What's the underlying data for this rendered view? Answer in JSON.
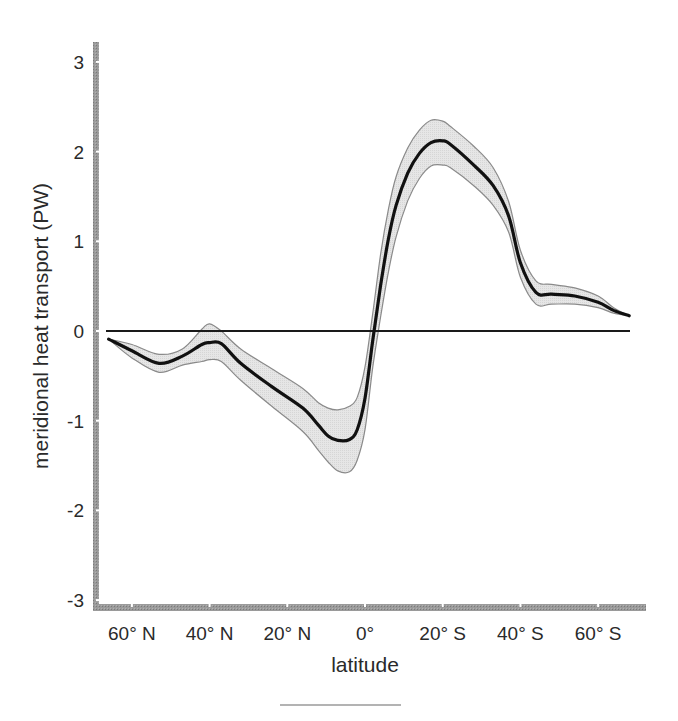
{
  "chart_data": {
    "type": "line",
    "title": "",
    "xlabel": "latitude",
    "ylabel": "meridional heat transport (PW)",
    "ylim": [
      -3,
      3
    ],
    "xlim_lat": [
      -65,
      65
    ],
    "grid": false,
    "legend": null,
    "x_ticks": [
      {
        "lat": -60,
        "label": "60° N"
      },
      {
        "lat": -40,
        "label": "40° N"
      },
      {
        "lat": -20,
        "label": "20° N"
      },
      {
        "lat": 0,
        "label": "0°"
      },
      {
        "lat": 20,
        "label": "20° S"
      },
      {
        "lat": 40,
        "label": "40° S"
      },
      {
        "lat": 60,
        "label": "60° S"
      }
    ],
    "y_ticks": [
      3,
      2,
      1,
      0,
      -1,
      -2,
      -3
    ],
    "x_note": "latitude expressed as signed degrees: negative = North, positive = South",
    "series": [
      {
        "name": "mean",
        "style": "thick black line",
        "x": [
          -66,
          -60,
          -53,
          -47,
          -42,
          -40,
          -37,
          -32,
          -24,
          -16,
          -12,
          -9.5,
          -7,
          -4,
          -2,
          0,
          2,
          4,
          6,
          8,
          11,
          14,
          17,
          20,
          22,
          28,
          33,
          37,
          40,
          44,
          48,
          54,
          60,
          64,
          68
        ],
        "values": [
          -0.09,
          -0.22,
          -0.36,
          -0.28,
          -0.15,
          -0.13,
          -0.14,
          -0.36,
          -0.62,
          -0.86,
          -1.05,
          -1.17,
          -1.22,
          -1.21,
          -1.1,
          -0.75,
          -0.1,
          0.5,
          1.02,
          1.4,
          1.76,
          1.98,
          2.1,
          2.12,
          2.08,
          1.85,
          1.62,
          1.28,
          0.76,
          0.43,
          0.41,
          0.39,
          0.32,
          0.23,
          0.17
        ]
      },
      {
        "name": "uncertainty upper",
        "style": "gray band edge",
        "x": [
          -66,
          -60,
          -53,
          -47,
          -42,
          -40,
          -37,
          -32,
          -24,
          -16,
          -12,
          -9.5,
          -7,
          -4,
          -2,
          0,
          2,
          4,
          6,
          8,
          11,
          14,
          17,
          20,
          22,
          28,
          33,
          37,
          40,
          44,
          48,
          54,
          60,
          64,
          68
        ],
        "values": [
          -0.09,
          -0.15,
          -0.26,
          -0.2,
          0.02,
          0.08,
          0.0,
          -0.2,
          -0.42,
          -0.64,
          -0.8,
          -0.86,
          -0.88,
          -0.84,
          -0.74,
          -0.4,
          0.2,
          0.85,
          1.35,
          1.72,
          2.04,
          2.24,
          2.35,
          2.34,
          2.28,
          2.06,
          1.82,
          1.44,
          0.9,
          0.56,
          0.52,
          0.48,
          0.39,
          0.26,
          0.17
        ]
      },
      {
        "name": "uncertainty lower",
        "style": "gray band edge",
        "x": [
          -66,
          -60,
          -53,
          -47,
          -42,
          -40,
          -37,
          -32,
          -24,
          -16,
          -12,
          -9.5,
          -7,
          -4,
          -2,
          0,
          2,
          4,
          6,
          8,
          11,
          14,
          17,
          20,
          22,
          28,
          33,
          37,
          40,
          44,
          48,
          54,
          60,
          64,
          68
        ],
        "values": [
          -0.09,
          -0.3,
          -0.46,
          -0.38,
          -0.34,
          -0.32,
          -0.34,
          -0.55,
          -0.84,
          -1.12,
          -1.33,
          -1.46,
          -1.56,
          -1.57,
          -1.44,
          -1.1,
          -0.4,
          0.15,
          0.65,
          1.05,
          1.45,
          1.7,
          1.84,
          1.85,
          1.82,
          1.62,
          1.4,
          1.1,
          0.6,
          0.3,
          0.3,
          0.3,
          0.26,
          0.2,
          0.17
        ]
      },
      {
        "name": "zero reference",
        "style": "thin black horizontal line",
        "x": [
          -67,
          68
        ],
        "values": [
          0,
          0
        ]
      }
    ]
  },
  "layout": {
    "plot_px": {
      "x0": 365,
      "px_per_deg": 3.885,
      "y0": 331,
      "px_per_unit": 89.7
    },
    "colors": {
      "axis_bar": "#8c8c8c",
      "band_fill": "#e3e3e3",
      "band_edge": "#8a8a8a",
      "mean_line": "#111111",
      "zero_line": "#1a1a1a",
      "text": "#2a2a2a"
    }
  }
}
